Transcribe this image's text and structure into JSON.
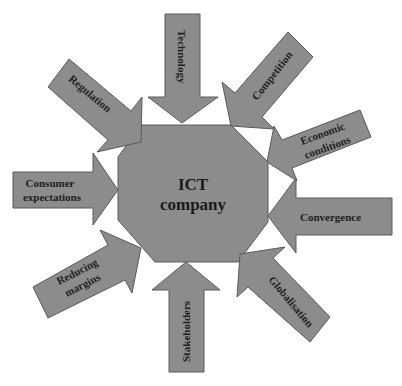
{
  "diagram": {
    "center": {
      "line1": "ICT",
      "line2": "company"
    },
    "forces": {
      "technology": {
        "label": "Technology"
      },
      "competition": {
        "label": "Competition"
      },
      "economic": {
        "line1": "Economic",
        "line2": "conditions"
      },
      "convergence": {
        "label": "Convergence"
      },
      "globalisation": {
        "label": "Globalisation"
      },
      "stakeholders": {
        "label": "Stakeholders"
      },
      "reducing": {
        "line1": "Reducing",
        "line2": "margins"
      },
      "consumer": {
        "line1": "Consumer",
        "line2": "expectations"
      },
      "regulation": {
        "label": "Regulation"
      }
    },
    "colors": {
      "fill": "#8c8c8c",
      "stroke": "#5a5a5a",
      "text": "#1e1e1e",
      "background": "#ffffff"
    }
  }
}
